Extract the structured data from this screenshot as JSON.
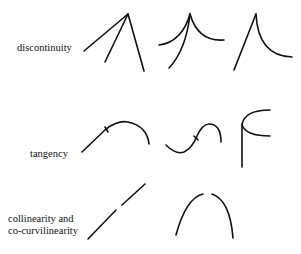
{
  "diagram": {
    "rows": [
      {
        "label": "discontinuity",
        "figures": 3
      },
      {
        "label": "tangency",
        "figures": 3
      },
      {
        "label_lines": [
          "collinearity and",
          "co-curvilinearity"
        ],
        "figures": 2
      }
    ],
    "colors": {
      "stroke": "#111111",
      "background": "#ffffff"
    }
  }
}
